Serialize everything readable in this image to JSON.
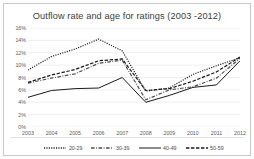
{
  "chart_data": {
    "type": "line",
    "title": "Outflow rate and age  for ratings (2003 -2012)",
    "xlabel": "",
    "ylabel": "",
    "grid": true,
    "legend_position": "bottom",
    "ylim": [
      0,
      16
    ],
    "ytick_labels": [
      "16%",
      "14%",
      "12%",
      "10%",
      "8%",
      "6%",
      "4%",
      "2%",
      "0%"
    ],
    "ytick_values": [
      16,
      14,
      12,
      10,
      8,
      6,
      4,
      2,
      0
    ],
    "categories": [
      "2003",
      "2004",
      "2005",
      "2006",
      "2007",
      "2008",
      "2009",
      "2010",
      "2011",
      "2012"
    ],
    "series": [
      {
        "name": "20-29",
        "line_style": "dotted",
        "color": "#1a1a1a",
        "values": [
          9.2,
          11.4,
          12.6,
          14.2,
          12.3,
          5.8,
          6.3,
          8.5,
          9.9,
          11.2
        ]
      },
      {
        "name": "30-39",
        "line_style": "dash-dot",
        "color": "#4d4d4d",
        "values": [
          7.1,
          7.9,
          8.6,
          10.3,
          10.8,
          4.4,
          6.0,
          6.5,
          7.9,
          11.1
        ]
      },
      {
        "name": "40-49",
        "line_style": "solid",
        "color": "#1a1a1a",
        "values": [
          4.8,
          5.9,
          6.2,
          6.3,
          8.0,
          4.0,
          5.1,
          6.4,
          6.8,
          10.7
        ]
      },
      {
        "name": "50-59",
        "line_style": "dashed",
        "color": "#1a1a1a",
        "values": [
          7.2,
          8.4,
          9.3,
          10.7,
          11.0,
          5.9,
          6.2,
          7.4,
          8.9,
          11.3
        ]
      }
    ]
  },
  "legend": {
    "items": [
      {
        "label": "20-29"
      },
      {
        "label": "30-39"
      },
      {
        "label": "40-49"
      },
      {
        "label": "50-59"
      }
    ]
  }
}
